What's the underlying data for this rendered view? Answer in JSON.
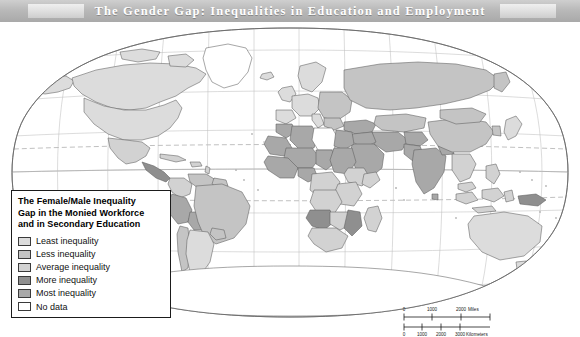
{
  "title": {
    "text": "The Gender Gap: Inequalities in Education and Employment"
  },
  "legend": {
    "title": "The Female/Male Inequality Gap in the Monied Workforce and in Secondary Education",
    "title_line1": "The Female/Male Inequality",
    "title_line2": "Gap in the Monied Workforce",
    "title_line3": "and in Secondary Education",
    "items": [
      {
        "label": "Least inequality",
        "color": "#dcdcdc"
      },
      {
        "label": "Less inequality",
        "color": "#c4c4c4"
      },
      {
        "label": "Average inequality",
        "color": "#d2d2d2"
      },
      {
        "label": "More inequality",
        "color": "#8f8f8f"
      },
      {
        "label": "Most inequality",
        "color": "#a8a8a8"
      },
      {
        "label": "No data",
        "color": "#ffffff"
      }
    ]
  },
  "scalebar": {
    "miles": {
      "ticks": [
        "0",
        "1000",
        "2000"
      ],
      "unit": "Miles"
    },
    "kilometers": {
      "ticks": [
        "0",
        "1000",
        "2000",
        "3000"
      ],
      "unit": "Kilometers"
    }
  },
  "map": {
    "projection": "robinson",
    "graticule": {
      "meridian_spacing_deg": 30,
      "parallel_spacing_deg": 30,
      "color": "#b9b9b9"
    },
    "special_parallels": [
      {
        "name": "Tropic of Cancer",
        "style": "dashed"
      },
      {
        "name": "Tropic of Capricorn",
        "style": "dashed"
      }
    ],
    "ocean_color": "#ffffff",
    "border_color": "#6a6a6a",
    "regions": [
      {
        "name": "Canada",
        "class": "Least inequality"
      },
      {
        "name": "United States",
        "class": "Least inequality"
      },
      {
        "name": "Greenland",
        "class": "No data"
      },
      {
        "name": "Mexico",
        "class": "Average inequality"
      },
      {
        "name": "Central America",
        "class": "More inequality"
      },
      {
        "name": "Caribbean",
        "class": "Average inequality"
      },
      {
        "name": "Colombia",
        "class": "Average inequality"
      },
      {
        "name": "Venezuela",
        "class": "Less inequality"
      },
      {
        "name": "Peru",
        "class": "Most inequality"
      },
      {
        "name": "Bolivia",
        "class": "Most inequality"
      },
      {
        "name": "Brazil",
        "class": "Less inequality"
      },
      {
        "name": "Argentina",
        "class": "Least inequality"
      },
      {
        "name": "Chile",
        "class": "Less inequality"
      },
      {
        "name": "Western Europe",
        "class": "Least inequality"
      },
      {
        "name": "Eastern Europe",
        "class": "Less inequality"
      },
      {
        "name": "Russia",
        "class": "Less inequality"
      },
      {
        "name": "Turkey",
        "class": "Most inequality"
      },
      {
        "name": "Libya",
        "class": "No data"
      },
      {
        "name": "Algeria",
        "class": "Most inequality"
      },
      {
        "name": "Morocco",
        "class": "Most inequality"
      },
      {
        "name": "Egypt",
        "class": "Most inequality"
      },
      {
        "name": "Sudan",
        "class": "Most inequality"
      },
      {
        "name": "Sahel",
        "class": "Most inequality"
      },
      {
        "name": "West Africa",
        "class": "Most inequality"
      },
      {
        "name": "Central Africa",
        "class": "Average inequality"
      },
      {
        "name": "Ethiopia",
        "class": "Average inequality"
      },
      {
        "name": "East Africa",
        "class": "Average inequality"
      },
      {
        "name": "Southern Africa",
        "class": "Average inequality"
      },
      {
        "name": "Angola",
        "class": "More inequality"
      },
      {
        "name": "Mozambique",
        "class": "More inequality"
      },
      {
        "name": "Madagascar",
        "class": "Average inequality"
      },
      {
        "name": "Arabian Peninsula",
        "class": "Most inequality"
      },
      {
        "name": "Iran",
        "class": "Most inequality"
      },
      {
        "name": "Iraq",
        "class": "Most inequality"
      },
      {
        "name": "Afghanistan",
        "class": "Most inequality"
      },
      {
        "name": "Pakistan",
        "class": "Most inequality"
      },
      {
        "name": "India",
        "class": "Most inequality"
      },
      {
        "name": "China",
        "class": "Less inequality"
      },
      {
        "name": "Mongolia",
        "class": "Less inequality"
      },
      {
        "name": "Southeast Asia",
        "class": "Average inequality"
      },
      {
        "name": "Indonesia",
        "class": "Average inequality"
      },
      {
        "name": "Philippines",
        "class": "Average inequality"
      },
      {
        "name": "Japan",
        "class": "Least inequality"
      },
      {
        "name": "Australia",
        "class": "Least inequality"
      },
      {
        "name": "New Zealand",
        "class": "Least inequality"
      },
      {
        "name": "Papua New Guinea",
        "class": "More inequality"
      },
      {
        "name": "Antarctica",
        "class": "No data"
      }
    ]
  }
}
